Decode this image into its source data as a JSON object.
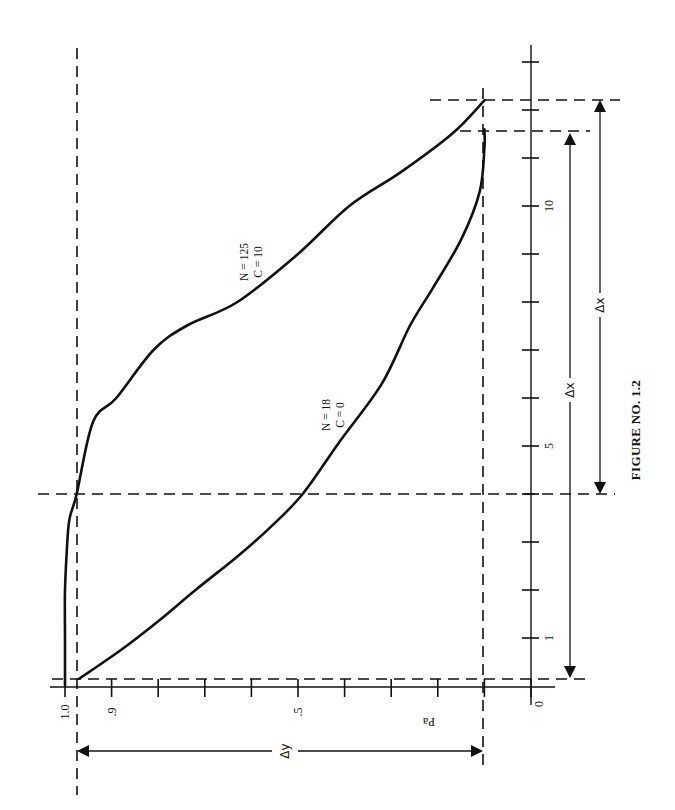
{
  "figure": {
    "caption": "FIGURE NO. 1.2",
    "orientation": "rotated 90deg counter-clockwise (Pa axis along bottom, x axis up the right side)"
  },
  "axes": {
    "pa_axis": {
      "label": "Pa",
      "tick_labels": [
        {
          "value": 1.0,
          "text": "1.0"
        },
        {
          "value": 0.9,
          "text": ".9"
        },
        {
          "value": 0.5,
          "text": ".5"
        },
        {
          "value": 0.0,
          "text": "0"
        }
      ],
      "ticks": [
        1.0,
        0.9,
        0.8,
        0.7,
        0.6,
        0.5,
        0.4,
        0.3,
        0.2,
        0.1,
        0.0
      ]
    },
    "x_axis": {
      "label": "",
      "tick_labels": [
        {
          "value": 1,
          "text": "1"
        },
        {
          "value": 5,
          "text": "5"
        },
        {
          "value": 10,
          "text": "10"
        }
      ],
      "ticks": [
        1,
        2,
        3,
        4,
        5,
        6,
        7,
        8,
        9,
        10,
        11,
        12,
        13
      ]
    }
  },
  "curve_labels": [
    {
      "id": "n125",
      "line1": "N = 125",
      "line2": "C = 10"
    },
    {
      "id": "n18",
      "line1": "N = 18",
      "line2": "C = 0"
    }
  ],
  "dimensions": {
    "delta_y": "Δy",
    "delta_x_inner": "Δx",
    "delta_x_outer": "Δx"
  },
  "chart_data": {
    "type": "line",
    "title": "FIGURE NO. 1.2",
    "xlabel": "",
    "ylabel": "Pa",
    "xlim": [
      0,
      13.5
    ],
    "ylim": [
      0,
      1.0
    ],
    "grid": false,
    "legend": "inline curve annotations",
    "annotations": [
      "Horizontal dashed reference lines at Pa ~0.975 and Pa ~0.10",
      "Vertical dashed reference lines at x = 4, x ~11.6, x ~12.2",
      "Δy dimension spans Pa 0.975 to 0.10",
      "Inner Δx dimension spans x = 0.15 to 11.6 (N=18 curve)",
      "Outer Δx dimension spans x = 4 to 12.2 (N=125, C=10 curve)"
    ],
    "series": [
      {
        "name": "N = 125, C = 10",
        "x": [
          0.0,
          1.0,
          2.0,
          3.0,
          3.5,
          4.0,
          5.5,
          6.0,
          7.0,
          7.5,
          8.0,
          9.0,
          10.0,
          10.7,
          11.5,
          12.2
        ],
        "y": [
          1.0,
          1.0,
          1.0,
          0.995,
          0.99,
          0.975,
          0.94,
          0.89,
          0.81,
          0.74,
          0.63,
          0.5,
          0.39,
          0.28,
          0.17,
          0.1
        ]
      },
      {
        "name": "N = 18, C = 0",
        "x": [
          0.15,
          0.75,
          1.35,
          2.0,
          2.7,
          3.3,
          4.0,
          5.1,
          6.3,
          7.5,
          8.3,
          9.3,
          10.3,
          11.2,
          11.6
        ],
        "y": [
          0.97,
          0.88,
          0.8,
          0.72,
          0.63,
          0.56,
          0.49,
          0.41,
          0.32,
          0.26,
          0.21,
          0.15,
          0.11,
          0.1,
          0.1
        ]
      }
    ]
  }
}
